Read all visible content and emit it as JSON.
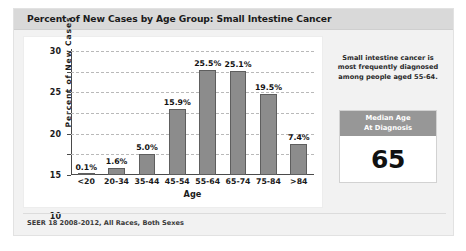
{
  "card": {
    "title": "Percent of New Cases by Age Group: Small Intestine Cancer",
    "footer": "SEER 18 2008-2012, All Races, Both Sexes"
  },
  "side_panel": {
    "note": "Small intestine cancer is most frequently diagnosed among people aged 55-64.",
    "median_box": {
      "header_line1": "Median Age",
      "header_line2": "At Diagnosis",
      "value": "65"
    }
  },
  "colors": {
    "bar_fill": "#8c8c8c",
    "bar_edge": "#5e5e5e",
    "title_band": "#d9d9d9",
    "median_header": "#979797",
    "gridline": "#b9b9b9",
    "axis": "#4a4a4a"
  },
  "chart_data": {
    "type": "bar",
    "title": "Percent of New Cases by Age Group: Small Intestine Cancer",
    "xlabel": "Age",
    "ylabel": "Percent of New Cases",
    "categories": [
      "<20",
      "20-34",
      "35-44",
      "45-54",
      "55-64",
      "65-74",
      "75-84",
      ">84"
    ],
    "values": [
      0.1,
      1.6,
      5.0,
      15.9,
      25.5,
      25.1,
      19.5,
      7.4
    ],
    "data_labels": [
      "0.1%",
      "1.6%",
      "5.0%",
      "15.9%",
      "25.5%",
      "25.1%",
      "19.5%",
      "7.4%"
    ],
    "ylim": [
      0,
      30
    ],
    "yticks": [
      0,
      5,
      10,
      15,
      20,
      25,
      30
    ],
    "ytick_labels": [
      "0",
      "5",
      "10",
      "15",
      "20",
      "25",
      "30"
    ],
    "grid": true,
    "grid_style": "dashed-horizontal",
    "legend": null,
    "source": "SEER 18 2008-2012, All Races, Both Sexes"
  }
}
